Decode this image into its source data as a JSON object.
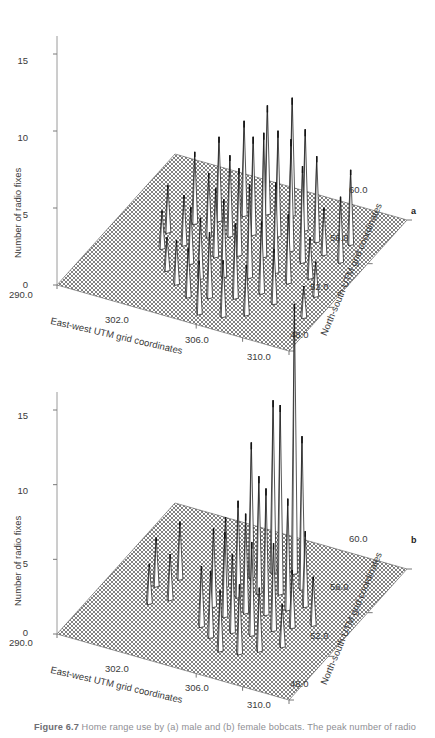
{
  "page": {
    "running_head": "",
    "background": "#ffffff"
  },
  "caption": {
    "figure_number": "Figure 6.7",
    "text": "Home range use by (a) male and (b) female bobcats. The peak number of radio"
  },
  "panels": [
    {
      "letter": "a",
      "subject": "male bobcat",
      "y_axis_label": "Number of radio fixes",
      "x_axis_label": "East-west UTM grid coordinates",
      "z_axis_label": "North-south UTM grid coordinates",
      "y_ticks": [
        "0",
        "5",
        "10",
        "15"
      ],
      "x_ticks": [
        "290.0",
        "302.0",
        "306.0",
        "310.0"
      ],
      "z_ticks": [
        "48.0",
        "52.0",
        "56.0",
        "60.0"
      ]
    },
    {
      "letter": "b",
      "subject": "female bobcat",
      "y_axis_label": "Number of radio fixes",
      "x_axis_label": "East-west UTM grid coordinates",
      "z_axis_label": "North-south UTM grid coordinates",
      "y_ticks": [
        "0",
        "5",
        "10",
        "15"
      ],
      "x_ticks": [
        "290.0",
        "302.0",
        "306.0",
        "310.0"
      ],
      "z_ticks": [
        "48.0",
        "52.0",
        "56.0",
        "60.0"
      ]
    }
  ],
  "chart_data": [
    {
      "type": "surface",
      "panel": "a",
      "title": "Home range use by male bobcats",
      "xlabel": "East-west UTM grid coordinates",
      "ylabel": "Number of radio fixes",
      "zlabel": "North-south UTM grid coordinates",
      "xlim": [
        290.0,
        310.0
      ],
      "zlim": [
        48.0,
        60.0
      ],
      "ylim": [
        0,
        17
      ],
      "xticks": [
        290.0,
        302.0,
        306.0,
        310.0
      ],
      "zticks": [
        48.0,
        52.0,
        56.0,
        60.0
      ],
      "yticks": [
        0,
        5,
        10,
        15
      ],
      "grid": "mesh",
      "legend": "none",
      "description": "Many scattered spikes of moderate height spread broadly across the grid; peak about 8 radio fixes.",
      "peak_value": 8,
      "spikes": [
        {
          "x": 294.3,
          "z": 54.2,
          "v": 3.0
        },
        {
          "x": 294.9,
          "z": 52.9,
          "v": 2.4
        },
        {
          "x": 295.6,
          "z": 55.4,
          "v": 4.6
        },
        {
          "x": 296.2,
          "z": 53.6,
          "v": 3.2
        },
        {
          "x": 296.6,
          "z": 51.4,
          "v": 2.1
        },
        {
          "x": 297.1,
          "z": 56.1,
          "v": 5.4
        },
        {
          "x": 297.4,
          "z": 54.7,
          "v": 4.1
        },
        {
          "x": 297.8,
          "z": 52.4,
          "v": 3.6
        },
        {
          "x": 298.1,
          "z": 50.6,
          "v": 2.8
        },
        {
          "x": 298.5,
          "z": 57.0,
          "v": 6.1
        },
        {
          "x": 298.8,
          "z": 55.2,
          "v": 5.2
        },
        {
          "x": 299.1,
          "z": 53.4,
          "v": 4.4
        },
        {
          "x": 299.4,
          "z": 51.5,
          "v": 3.9
        },
        {
          "x": 299.7,
          "z": 49.9,
          "v": 3.1
        },
        {
          "x": 300.0,
          "z": 57.6,
          "v": 7.0
        },
        {
          "x": 300.3,
          "z": 55.8,
          "v": 6.3
        },
        {
          "x": 300.6,
          "z": 54.0,
          "v": 5.6
        },
        {
          "x": 300.9,
          "z": 52.1,
          "v": 5.0
        },
        {
          "x": 301.2,
          "z": 50.3,
          "v": 4.2
        },
        {
          "x": 301.5,
          "z": 48.9,
          "v": 3.4
        },
        {
          "x": 301.8,
          "z": 58.0,
          "v": 7.6
        },
        {
          "x": 302.1,
          "z": 56.2,
          "v": 6.8
        },
        {
          "x": 302.4,
          "z": 54.4,
          "v": 8.0
        },
        {
          "x": 302.7,
          "z": 52.6,
          "v": 6.0
        },
        {
          "x": 303.0,
          "z": 50.8,
          "v": 4.8
        },
        {
          "x": 303.3,
          "z": 49.2,
          "v": 3.6
        },
        {
          "x": 303.6,
          "z": 57.2,
          "v": 6.5
        },
        {
          "x": 303.9,
          "z": 55.4,
          "v": 7.2
        },
        {
          "x": 304.2,
          "z": 53.5,
          "v": 5.8
        },
        {
          "x": 304.5,
          "z": 51.7,
          "v": 4.6
        },
        {
          "x": 304.8,
          "z": 49.8,
          "v": 3.2
        },
        {
          "x": 305.1,
          "z": 56.6,
          "v": 5.5
        },
        {
          "x": 305.4,
          "z": 54.8,
          "v": 6.2
        },
        {
          "x": 305.7,
          "z": 53.0,
          "v": 4.4
        },
        {
          "x": 306.0,
          "z": 51.2,
          "v": 3.5
        },
        {
          "x": 306.4,
          "z": 55.8,
          "v": 3.0
        },
        {
          "x": 306.9,
          "z": 53.8,
          "v": 2.6
        },
        {
          "x": 307.6,
          "z": 57.1,
          "v": 4.8
        },
        {
          "x": 308.0,
          "z": 55.6,
          "v": 4.2
        },
        {
          "x": 308.4,
          "z": 52.6,
          "v": 2.2
        },
        {
          "x": 308.9,
          "z": 50.8,
          "v": 2.0
        }
      ]
    },
    {
      "type": "surface",
      "panel": "b",
      "title": "Home range use by female bobcats",
      "xlabel": "East-west UTM grid coordinates",
      "ylabel": "Number of radio fixes",
      "zlabel": "North-south UTM grid coordinates",
      "xlim": [
        290.0,
        310.0
      ],
      "zlim": [
        48.0,
        60.0
      ],
      "ylim": [
        0,
        19
      ],
      "xticks": [
        290.0,
        302.0,
        306.0,
        310.0
      ],
      "zticks": [
        48.0,
        52.0,
        56.0,
        60.0
      ],
      "yticks": [
        0,
        5,
        10,
        15
      ],
      "grid": "mesh",
      "legend": "none",
      "description": "A tightly clustered group of spikes near the centre with one dominant peak reaching about 18 radio fixes.",
      "peak_value": 18,
      "spikes": [
        {
          "x": 293.8,
          "z": 53.6,
          "v": 3.2
        },
        {
          "x": 294.4,
          "z": 52.2,
          "v": 2.6
        },
        {
          "x": 295.0,
          "z": 54.6,
          "v": 3.8
        },
        {
          "x": 295.6,
          "z": 52.9,
          "v": 3.0
        },
        {
          "x": 298.6,
          "z": 55.0,
          "v": 4.6
        },
        {
          "x": 299.0,
          "z": 53.3,
          "v": 5.2
        },
        {
          "x": 299.4,
          "z": 51.6,
          "v": 4.0
        },
        {
          "x": 299.8,
          "z": 56.2,
          "v": 9.0
        },
        {
          "x": 300.1,
          "z": 54.5,
          "v": 6.4
        },
        {
          "x": 300.4,
          "z": 52.8,
          "v": 5.6
        },
        {
          "x": 300.7,
          "z": 51.0,
          "v": 4.4
        },
        {
          "x": 301.0,
          "z": 57.0,
          "v": 11.5
        },
        {
          "x": 301.3,
          "z": 55.2,
          "v": 7.8
        },
        {
          "x": 301.6,
          "z": 53.5,
          "v": 6.6
        },
        {
          "x": 301.9,
          "z": 51.8,
          "v": 5.2
        },
        {
          "x": 302.2,
          "z": 50.2,
          "v": 4.0
        },
        {
          "x": 302.5,
          "z": 57.4,
          "v": 18.0
        },
        {
          "x": 302.8,
          "z": 55.6,
          "v": 12.6
        },
        {
          "x": 303.1,
          "z": 53.8,
          "v": 8.4
        },
        {
          "x": 303.4,
          "z": 52.0,
          "v": 6.2
        },
        {
          "x": 303.7,
          "z": 50.4,
          "v": 4.6
        },
        {
          "x": 304.0,
          "z": 56.4,
          "v": 10.2
        },
        {
          "x": 304.3,
          "z": 54.6,
          "v": 7.4
        },
        {
          "x": 304.6,
          "z": 52.8,
          "v": 5.8
        },
        {
          "x": 304.9,
          "z": 51.0,
          "v": 4.2
        },
        {
          "x": 305.3,
          "z": 55.2,
          "v": 5.0
        },
        {
          "x": 305.7,
          "z": 53.4,
          "v": 3.8
        },
        {
          "x": 306.2,
          "z": 51.8,
          "v": 2.8
        },
        {
          "x": 307.0,
          "z": 54.0,
          "v": 3.2
        }
      ]
    }
  ]
}
